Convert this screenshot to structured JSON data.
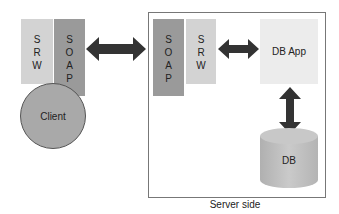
{
  "client_side": {
    "srw_block": {
      "letters": [
        "S",
        "R",
        "W"
      ]
    },
    "soap_block": {
      "letters": [
        "S",
        "O",
        "A",
        "P"
      ]
    },
    "client_node": {
      "label": "Client"
    }
  },
  "server_side": {
    "caption": "Server side",
    "soap_block": {
      "letters": [
        "S",
        "O",
        "A",
        "P"
      ]
    },
    "srw_block": {
      "letters": [
        "S",
        "R",
        "W"
      ]
    },
    "db_app": {
      "label": "DB App"
    },
    "db": {
      "label": "DB"
    }
  },
  "arrows": [
    {
      "name": "client-server-arrow",
      "direction": "bidirectional-horizontal"
    },
    {
      "name": "srw-dbapp-arrow",
      "direction": "bidirectional-horizontal"
    },
    {
      "name": "dbapp-db-arrow",
      "direction": "bidirectional-vertical"
    }
  ],
  "colors": {
    "srw": "#d3d3d3",
    "soap": "#9a9a9a",
    "db_app": "#ececec",
    "client": "#a9a9a9",
    "db": "#c2c2c2",
    "arrow": "#333333"
  }
}
